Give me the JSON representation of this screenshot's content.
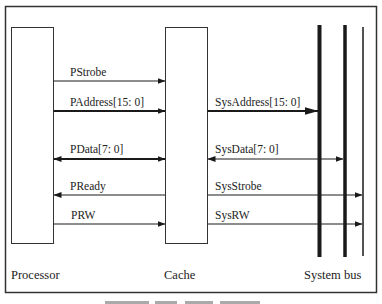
{
  "diagram": {
    "blocks": [
      {
        "id": "processor",
        "label": "Processor"
      },
      {
        "id": "cache",
        "label": "Cache"
      },
      {
        "id": "system_bus",
        "label": "System bus"
      }
    ],
    "processor_cache_signals": [
      {
        "label": "PStrobe",
        "direction": "processor-to-cache"
      },
      {
        "label": "PAddress[15: 0]",
        "direction": "processor-to-cache"
      },
      {
        "label": "PData[7: 0]",
        "direction": "bidirectional"
      },
      {
        "label": "PReady",
        "direction": "cache-to-processor"
      },
      {
        "label": "PRW",
        "direction": "processor-to-cache"
      }
    ],
    "cache_bus_signals": [
      {
        "label": "SysAddress[15: 0]",
        "direction": "cache-to-bus"
      },
      {
        "label": "SysData[7: 0]",
        "direction": "bidirectional"
      },
      {
        "label": "SysStrobe",
        "direction": "cache-to-bus"
      },
      {
        "label": "SysRW",
        "direction": "cache-to-bus"
      }
    ],
    "colors": {
      "line": "#1a1a1a",
      "frame": "#333333",
      "background": "#ffffff"
    }
  }
}
